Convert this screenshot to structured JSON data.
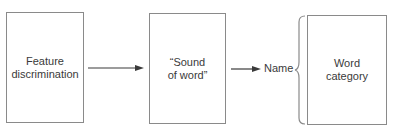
{
  "diagram": {
    "type": "flow",
    "nodes": [
      {
        "id": "feature",
        "label": "Feature\ndiscrimination"
      },
      {
        "id": "sound",
        "label": "“Sound\nof word”"
      },
      {
        "id": "name",
        "label": "Name"
      },
      {
        "id": "category",
        "label": "Word\ncategory"
      }
    ],
    "edges": [
      {
        "from": "feature",
        "to": "sound",
        "style": "arrow"
      },
      {
        "from": "sound",
        "to": "name",
        "style": "arrow"
      },
      {
        "from": "name",
        "to": "category",
        "style": "brace"
      }
    ],
    "colors": {
      "stroke": "#8a8a8a",
      "arrow": "#3a3a3a",
      "text": "#3a3a3a"
    }
  }
}
